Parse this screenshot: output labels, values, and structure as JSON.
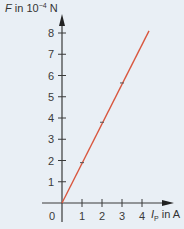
{
  "chart_data": {
    "type": "line",
    "title": "",
    "xlabel": "I_P in A",
    "ylabel": "F in 10^-4 N",
    "xlabel_parts": {
      "symbol": "I",
      "sub": "P",
      "unit": "in A"
    },
    "ylabel_parts": {
      "symbol": "F",
      "unit_prefix": "in 10",
      "exp": "−4",
      "unit": "N"
    },
    "x_ticks": [
      0,
      1,
      2,
      3,
      4
    ],
    "y_ticks": [
      1,
      2,
      3,
      4,
      5,
      6,
      7,
      8
    ],
    "xlim": [
      0,
      4.5
    ],
    "ylim": [
      0,
      8.5
    ],
    "grid": false,
    "legend": "none",
    "series": [
      {
        "name": "F(I_P)",
        "color": "#d9573f",
        "line": {
          "x": [
            0,
            4.35
          ],
          "y": [
            0,
            8.1
          ]
        },
        "points": {
          "x": [
            1,
            2,
            3
          ],
          "y": [
            1.9,
            3.8,
            5.65
          ]
        }
      }
    ]
  },
  "labels": {
    "y_symbol": "F",
    "y_unit": " in 10",
    "y_exp": "−4",
    "y_unit_end": " N",
    "x_symbol": "I",
    "x_sub": "P",
    "x_unit": " in A",
    "origin": "0"
  },
  "colors": {
    "background": "#e9eff5",
    "axis": "#3a3a3a",
    "line": "#d9573f"
  }
}
